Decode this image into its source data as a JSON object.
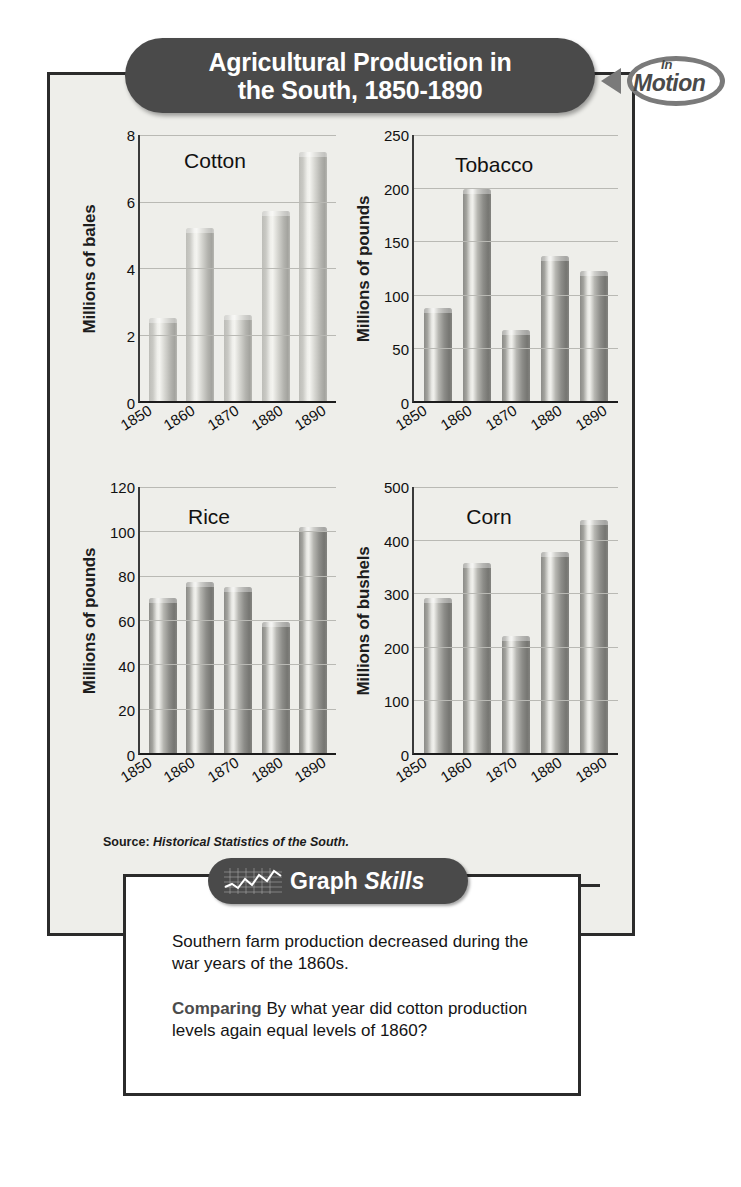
{
  "title": {
    "line1": "Agricultural Production in",
    "line2": "the South, 1850-1890",
    "full": "Agricultural Production in\nthe South, 1850-1890"
  },
  "badge": {
    "small_word": "In",
    "large_word": "Motion"
  },
  "source": {
    "label": "Source:",
    "citation": "Historical Statistics of the South."
  },
  "graph_skills": {
    "word1": "Graph",
    "word2": "Skills"
  },
  "question_box": {
    "paragraph": "Southern farm production decreased during the war years of the 1860s.",
    "prompt_label": "Comparing",
    "prompt_text": "By what year did cotton production levels again equal levels of 1860?"
  },
  "chart_data": [
    {
      "type": "bar",
      "title": "Cotton",
      "xlabel": "",
      "ylabel": "Millions of bales",
      "categories": [
        "1850",
        "1860",
        "1870",
        "1880",
        "1890"
      ],
      "values": [
        2.5,
        5.2,
        2.6,
        5.7,
        7.5
      ],
      "ylim": [
        0,
        8
      ],
      "yticks": [
        0,
        2,
        4,
        6,
        8
      ],
      "grid": true,
      "legend": "none",
      "bar_style": "light"
    },
    {
      "type": "bar",
      "title": "Tobacco",
      "xlabel": "",
      "ylabel": "Millions of pounds",
      "categories": [
        "1850",
        "1860",
        "1870",
        "1880",
        "1890"
      ],
      "values": [
        87,
        199,
        67,
        136,
        122
      ],
      "ylim": [
        0,
        250
      ],
      "yticks": [
        0,
        50,
        100,
        150,
        200,
        250
      ],
      "grid": true,
      "legend": "none",
      "bar_style": "dark"
    },
    {
      "type": "bar",
      "title": "Rice",
      "xlabel": "",
      "ylabel": "Millions of pounds",
      "categories": [
        "1850",
        "1860",
        "1870",
        "1880",
        "1890"
      ],
      "values": [
        70,
        77,
        75,
        59,
        102
      ],
      "ylim": [
        0,
        120
      ],
      "yticks": [
        0,
        20,
        40,
        60,
        80,
        100,
        120
      ],
      "grid": true,
      "legend": "none",
      "bar_style": "dark"
    },
    {
      "type": "bar",
      "title": "Corn",
      "xlabel": "",
      "ylabel": "Millions of bushels",
      "categories": [
        "1850",
        "1860",
        "1870",
        "1880",
        "1890"
      ],
      "values": [
        292,
        357,
        220,
        378,
        438
      ],
      "ylim": [
        0,
        500
      ],
      "yticks": [
        0,
        100,
        200,
        300,
        400,
        500
      ],
      "grid": true,
      "legend": "none",
      "bar_style": "dark"
    }
  ],
  "colors": {
    "pill": "#4a4a4a",
    "frame_border": "#2b2b2b",
    "panel_background": "#eeeeea",
    "gridline": "#b9b9b4",
    "text": "#141414"
  }
}
